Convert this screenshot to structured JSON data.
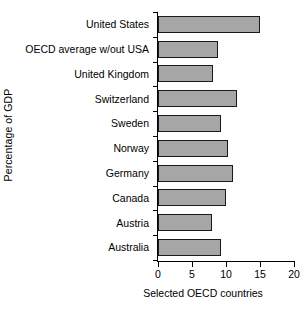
{
  "chart_data": {
    "type": "bar",
    "orientation": "horizontal",
    "title": "",
    "xlabel": "Selected OECD countries",
    "ylabel": "Percentage of GDP",
    "categories": [
      "United States",
      "OECD average w/out USA",
      "United Kingdom",
      "Switzerland",
      "Sweden",
      "Norway",
      "Germany",
      "Canada",
      "Austria",
      "Australia"
    ],
    "values": [
      15.0,
      8.8,
      8.1,
      11.6,
      9.3,
      10.3,
      11.1,
      10.0,
      7.9,
      9.3
    ],
    "xlim": [
      0,
      20
    ],
    "xticks": [
      0,
      5,
      10,
      15,
      20
    ],
    "xtick_labels": [
      "0",
      "5",
      "10",
      "15",
      "20"
    ],
    "grid": false,
    "legend": false,
    "bar_fill_color": "#a6a6a6",
    "bar_edge_color": "#1a1a1a",
    "axis_color": "#000000",
    "background_color": "#ffffff"
  }
}
